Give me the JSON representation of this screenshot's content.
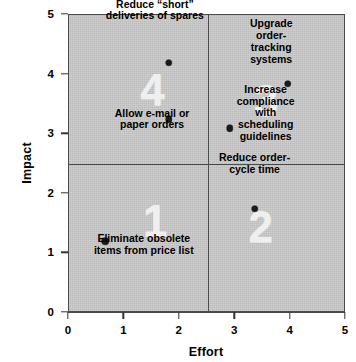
{
  "chart_data": {
    "type": "scatter",
    "title": "",
    "xlabel": "Effort",
    "ylabel": "Impact",
    "xlim": [
      0,
      5
    ],
    "ylim": [
      0,
      5
    ],
    "xticks": [
      "0",
      "1",
      "2",
      "3",
      "4",
      "5"
    ],
    "yticks": [
      "0",
      "1",
      "2",
      "3",
      "4",
      "5"
    ],
    "xtick_values": [
      0,
      1,
      2,
      3,
      4,
      5
    ],
    "ytick_values": [
      0,
      1,
      2,
      3,
      4,
      5
    ],
    "grid": false,
    "legend": "none",
    "quadrant_divider_x": 2.5,
    "quadrant_divider_y": 2.5,
    "quadrants": [
      {
        "number": "1",
        "x": 1.55,
        "y": 1.55,
        "region": "low-effort low-impact"
      },
      {
        "number": "2",
        "x": 3.45,
        "y": 1.45,
        "region": "high-effort low-impact"
      },
      {
        "number": "3",
        "x": 3.55,
        "y": 3.55,
        "region": "high-effort high-impact"
      },
      {
        "number": "4",
        "x": 1.5,
        "y": 3.75,
        "region": "low-effort high-impact"
      }
    ],
    "points": [
      {
        "label": "Eliminate obsolete\nitems from price list",
        "x": 0.65,
        "y": 1.2,
        "label_x": 1.35,
        "label_y": 0.95,
        "quadrant": "1"
      },
      {
        "label": "Reduce “short”\ndeliveries of spares",
        "x": 1.8,
        "y": 4.2,
        "label_x": 1.55,
        "label_y": 4.88,
        "quadrant": "4"
      },
      {
        "label": "Allow e-mail or\npaper orders",
        "x": 1.8,
        "y": 3.25,
        "label_x": 1.5,
        "label_y": 3.05,
        "quadrant": "4"
      },
      {
        "label": "Upgrade order-\ntracking systems",
        "x": 3.95,
        "y": 3.85,
        "label_x": 3.65,
        "label_y": 4.55,
        "quadrant": "3"
      },
      {
        "label": "Increase compliance\nwith scheduling\nguidelines",
        "x": 2.9,
        "y": 3.1,
        "label_x": 3.55,
        "label_y": 3.25,
        "quadrant": "3"
      },
      {
        "label": "Reduce order-\ncycle time",
        "x": 3.35,
        "y": 1.75,
        "label_x": 3.35,
        "label_y": 2.3,
        "quadrant": "2"
      }
    ],
    "colors": {
      "plot_background": "#c9c9c9",
      "axis": "#4b4b4b",
      "point": "#1a1a1a",
      "quadrant_numeral": "#efefef",
      "text": "#000000",
      "page_background": "#ffffff"
    }
  }
}
